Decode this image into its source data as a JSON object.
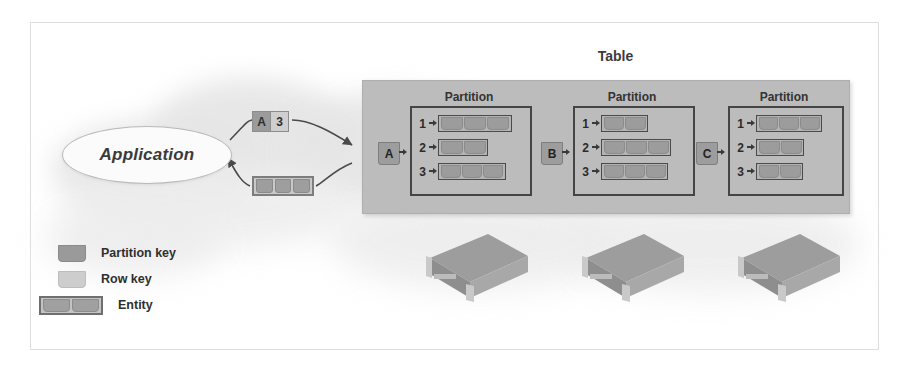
{
  "figure": {
    "table_label": "Table",
    "application_label": "Application"
  },
  "query": {
    "request_partition_key": "A",
    "request_row_key": "3",
    "response_entity_cells": 3
  },
  "table": {
    "partition_title": "Partition",
    "partitions": [
      {
        "key": "A",
        "title": "Partition",
        "rows": [
          {
            "num": "1",
            "cells": 3,
            "width": 74
          },
          {
            "num": "2",
            "cells": 2,
            "width": 50
          },
          {
            "num": "3",
            "cells": 3,
            "width": 68
          }
        ]
      },
      {
        "key": "B",
        "title": "Partition",
        "rows": [
          {
            "num": "1",
            "cells": 2,
            "width": 47
          },
          {
            "num": "2",
            "cells": 3,
            "width": 70
          },
          {
            "num": "3",
            "cells": 3,
            "width": 67
          }
        ]
      },
      {
        "key": "C",
        "title": "Partition",
        "rows": [
          {
            "num": "1",
            "cells": 3,
            "width": 66
          },
          {
            "num": "2",
            "cells": 2,
            "width": 48
          },
          {
            "num": "3",
            "cells": 2,
            "width": 47
          }
        ]
      }
    ]
  },
  "legend": {
    "items": [
      {
        "label": "Partition key",
        "swatch": "partition-key-swatch"
      },
      {
        "label": "Row key",
        "swatch": "row-key-swatch"
      },
      {
        "label": "Entity",
        "swatch": "entity-swatch"
      }
    ]
  },
  "servers": {
    "count": 3,
    "name": "storage-node"
  },
  "colors": {
    "table_fill": "#bcbcbc",
    "partition_key": "#9d9d9d",
    "row_key": "#cfcfcf",
    "entity_border": "#4a4a4a",
    "cloud": "#e6e6e6",
    "text": "#333333"
  }
}
